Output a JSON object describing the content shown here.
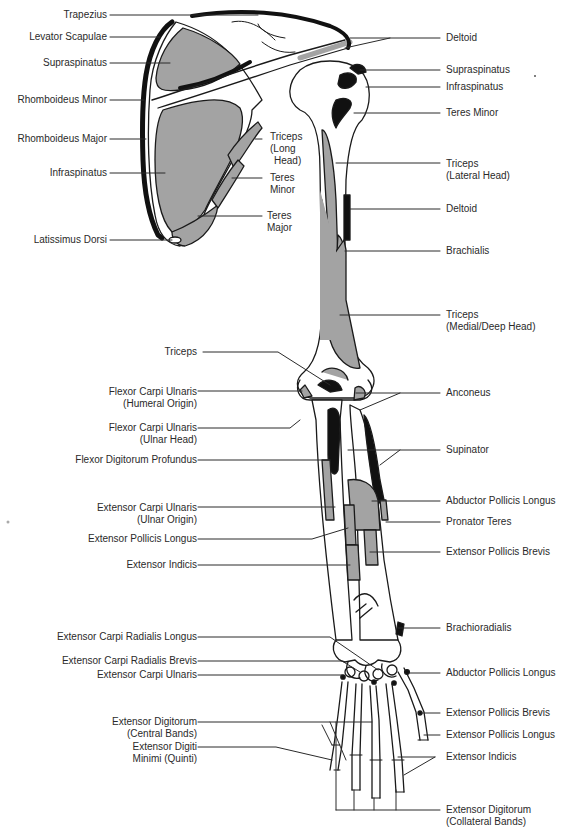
{
  "diagram": {
    "type": "anatomical illustration",
    "colors": {
      "muscle_gray": "#a3a3a3",
      "origin_black": "#111111",
      "bone_outline": "#1a1a1a",
      "background": "#ffffff"
    }
  },
  "labels_left": [
    {
      "id": "trapezius",
      "text": "Trapezius"
    },
    {
      "id": "levator-scapulae",
      "text": "Levator Scapulae"
    },
    {
      "id": "supraspinatus-l",
      "text": "Supraspinatus"
    },
    {
      "id": "rhomboideus-minor",
      "text": "Rhomboideus Minor"
    },
    {
      "id": "rhomboideus-major",
      "text": "Rhomboideus Major"
    },
    {
      "id": "infraspinatus-l",
      "text": "Infraspinatus"
    },
    {
      "id": "latissimus-dorsi",
      "text": "Latissimus Dorsi"
    },
    {
      "id": "triceps-elbow",
      "text": "Triceps"
    },
    {
      "id": "fcu-humeral",
      "text": "Flexor Carpi Ulnaris",
      "text2": "(Humeral  Origin)"
    },
    {
      "id": "fcu-ulnar",
      "text": "Flexor Carpi Ulnaris",
      "text2": "(Ulnar Head)"
    },
    {
      "id": "fdp",
      "text": "Flexor Digitorum Profundus"
    },
    {
      "id": "ecu-ulnar",
      "text": "Extensor Carpi Ulnaris",
      "text2": "(Ulnar Origin)"
    },
    {
      "id": "epl-forearm",
      "text": "Extensor Pollicis Longus"
    },
    {
      "id": "ei-forearm",
      "text": "Extensor Indicis"
    },
    {
      "id": "ecrl",
      "text": "Extensor Carpi Radialis Longus"
    },
    {
      "id": "ecrb",
      "text": "Extensor Carpi Radialis Brevis"
    },
    {
      "id": "ecu-hand",
      "text": "Extensor Carpi Ulnaris"
    },
    {
      "id": "ed-central",
      "text": "Extensor Digitorum",
      "text2": "(Central Bands)"
    },
    {
      "id": "edm",
      "text": "Extensor Digiti",
      "text2": "Minimi (Quinti)"
    }
  ],
  "labels_inner": [
    {
      "id": "triceps-long",
      "text": "Triceps",
      "text2": "(Long",
      "text3": "Head)"
    },
    {
      "id": "teres-minor-inner",
      "text": "Teres",
      "text2": "Minor"
    },
    {
      "id": "teres-major",
      "text": "Teres",
      "text2": "Major"
    }
  ],
  "labels_right": [
    {
      "id": "deltoid-top",
      "text": "Deltoid"
    },
    {
      "id": "supraspinatus-r",
      "text": "Supraspinatus"
    },
    {
      "id": "infraspinatus-r",
      "text": "Infraspinatus"
    },
    {
      "id": "teres-minor-r",
      "text": "Teres Minor"
    },
    {
      "id": "triceps-lateral",
      "text": "Triceps",
      "text2": "(Lateral Head)"
    },
    {
      "id": "deltoid-humerus",
      "text": "Deltoid"
    },
    {
      "id": "brachialis",
      "text": "Brachialis"
    },
    {
      "id": "triceps-medial",
      "text": "Triceps",
      "text2": "(Medial/Deep Head)"
    },
    {
      "id": "anconeus",
      "text": "Anconeus"
    },
    {
      "id": "supinator",
      "text": "Supinator"
    },
    {
      "id": "apl-forearm",
      "text": "Abductor Pollicis Longus"
    },
    {
      "id": "pronator-teres",
      "text": "Pronator Teres"
    },
    {
      "id": "epb-forearm",
      "text": "Extensor Pollicis Brevis"
    },
    {
      "id": "brachioradialis",
      "text": "Brachioradialis"
    },
    {
      "id": "apl-hand",
      "text": "Abductor Pollicis Longus"
    },
    {
      "id": "epb-hand",
      "text": "Extensor Pollicis Brevis"
    },
    {
      "id": "epl-hand",
      "text": "Extensor Pollicis Longus"
    },
    {
      "id": "ei-hand",
      "text": "Extensor Indicis"
    },
    {
      "id": "ed-collateral",
      "text": "Extensor Digitorum",
      "text2": "(Collateral Bands)"
    }
  ]
}
